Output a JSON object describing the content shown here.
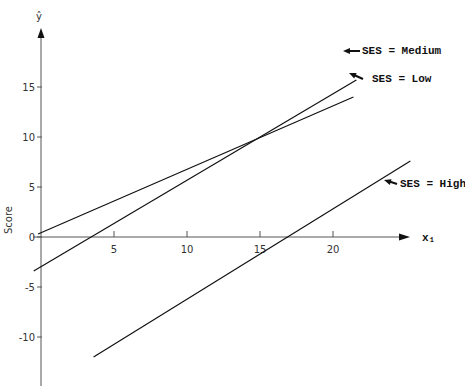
{
  "chart_data": {
    "type": "line",
    "title": "",
    "xlabel": "x₁",
    "ylabel": "Score",
    "y_axis_title": "ŷ",
    "xlim": [
      0,
      25
    ],
    "ylim": [
      -15,
      20
    ],
    "grid": false,
    "legend_position": "inline-right",
    "x_ticks": [
      5,
      10,
      15,
      20
    ],
    "y_ticks": [
      -10,
      -5,
      0,
      5,
      10,
      15
    ],
    "series": [
      {
        "name": "SES = Medium",
        "label": "SES = Medium",
        "x": [
          -0.5,
          21.6
        ],
        "y": [
          -3.4,
          15.7
        ],
        "color": "#111111"
      },
      {
        "name": "SES = Low",
        "label": "SES = Low",
        "x": [
          -0.2,
          21.4
        ],
        "y": [
          0.3,
          14.0
        ],
        "color": "#111111"
      },
      {
        "name": "SES = High",
        "label": "SES = High",
        "x": [
          3.6,
          25.3
        ],
        "y": [
          -12.0,
          7.6
        ],
        "color": "#111111"
      }
    ]
  },
  "layout": {
    "origin_px": [
      41,
      237
    ],
    "px_per_x": 14.6,
    "px_per_y": 10,
    "x_axis_end_px": 410,
    "y_axis_top_px": 28,
    "y_axis_bottom_px": 386
  }
}
